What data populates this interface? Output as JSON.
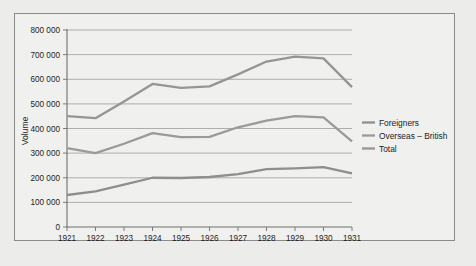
{
  "chart_data": {
    "type": "line",
    "title": "",
    "xlabel": "",
    "ylabel": "Volume",
    "categories": [
      "1921",
      "1922",
      "1923",
      "1924",
      "1925",
      "1926",
      "1927",
      "1928",
      "1929",
      "1930",
      "1931"
    ],
    "x": [
      1921,
      1922,
      1923,
      1924,
      1925,
      1926,
      1927,
      1928,
      1929,
      1930,
      1931
    ],
    "ylim": [
      0,
      800000
    ],
    "ytick_values": [
      0,
      100000,
      200000,
      300000,
      400000,
      500000,
      600000,
      700000,
      800000
    ],
    "ytick_labels": [
      "0",
      "100 000",
      "200 000",
      "300 000",
      "400 000",
      "500 000",
      "600 000",
      "700 000",
      "800 000"
    ],
    "grid": true,
    "legend_position": "right",
    "series": [
      {
        "name": "Foreigners",
        "color": "#8e8e8e",
        "values": [
          130000,
          145000,
          172000,
          200000,
          199000,
          203000,
          215000,
          235000,
          238000,
          243000,
          218000
        ]
      },
      {
        "name": "Overseas – British",
        "color": "#9a9a9a",
        "values": [
          320000,
          300000,
          338000,
          381000,
          365000,
          366000,
          405000,
          432000,
          450000,
          445000,
          348000
        ]
      },
      {
        "name": "Total",
        "color": "#959595",
        "values": [
          450000,
          442000,
          510000,
          581000,
          565000,
          571000,
          620000,
          672000,
          692000,
          685000,
          568000
        ]
      }
    ]
  },
  "legend": {
    "entries": [
      {
        "label": "Foreigners"
      },
      {
        "label": "Overseas – British"
      },
      {
        "label": "Total"
      }
    ]
  },
  "axes": {
    "y_axis_title": "Volume"
  },
  "colors": {
    "page_background": "#e9e9e7",
    "frame_background": "#f0f0ef",
    "frame_border": "#8b8b8b",
    "gridline": "#9c9c9c",
    "axis": "#6f6f6f",
    "text": "#1d1d1d"
  }
}
